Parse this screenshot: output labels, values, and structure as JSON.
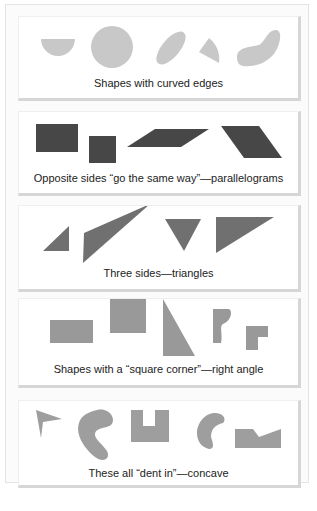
{
  "figure": {
    "panels": [
      {
        "id": "curved",
        "caption": "Shapes with curved edges",
        "shape_color": "#c8c8c8",
        "shapes": [
          "half-circle",
          "circle",
          "ellipse",
          "circular-sector",
          "bean-shape"
        ]
      },
      {
        "id": "parallelograms",
        "caption": "Opposite sides “go the same way”—parallelograms",
        "shape_color": "#474747",
        "shapes": [
          "rectangle",
          "square",
          "slanted-parallelogram",
          "trapezoid-parallelogram"
        ]
      },
      {
        "id": "triangles",
        "caption": "Three sides—triangles",
        "shape_color": "#707070",
        "shapes": [
          "small-right-triangle",
          "long-thin-triangle",
          "inverted-triangle",
          "wide-triangle"
        ]
      },
      {
        "id": "right-angle",
        "caption": "Shapes with a “square corner”—right angle",
        "shape_color": "#999999",
        "shapes": [
          "rectangle",
          "square",
          "right-triangle",
          "curvy-right-shape",
          "l-shape"
        ]
      },
      {
        "id": "concave",
        "caption": "These all “dent in”—concave",
        "shape_color": "#9e9e9e",
        "shapes": [
          "arrowhead",
          "kidney-shape",
          "u-block",
          "c-crescent",
          "notched-rectangle"
        ]
      }
    ]
  }
}
